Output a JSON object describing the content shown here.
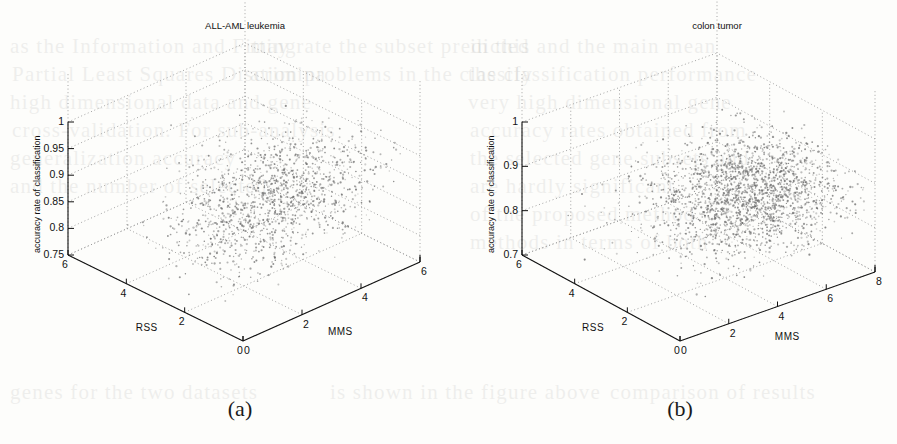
{
  "figure": {
    "background_color": "#fdfdfb",
    "ink_color": "#111111",
    "grid_color": "#9a9a9a",
    "point_color": "#6b6b6b"
  },
  "bleed_through_text": [
    {
      "text": "as the Information and Fitting",
      "x": 10,
      "y": 34
    },
    {
      "text": "may rate the subset predicted",
      "x": 250,
      "y": 34
    },
    {
      "text": "Partial Least Squares Discrimina",
      "x": 12,
      "y": 62
    },
    {
      "text": "ation problems in the classify",
      "x": 250,
      "y": 62
    },
    {
      "text": "high dimensional data and gene",
      "x": 10,
      "y": 90
    },
    {
      "text": "very high dimensional gene",
      "x": 468,
      "y": 90
    },
    {
      "text": "cross-validation. For sub-analysis",
      "x": 12,
      "y": 118
    },
    {
      "text": "the classification performance",
      "x": 468,
      "y": 62
    },
    {
      "text": "in this and the main mean",
      "x": 470,
      "y": 34
    },
    {
      "text": "accuracy rates obtained from",
      "x": 470,
      "y": 118
    },
    {
      "text": "the selected gene subsets and",
      "x": 470,
      "y": 146
    },
    {
      "text": "are hardly significant",
      "x": 470,
      "y": 174
    },
    {
      "text": "of the proposed method",
      "x": 470,
      "y": 202
    },
    {
      "text": "methods in terms of both",
      "x": 470,
      "y": 230
    },
    {
      "text": "generalization accuracy",
      "x": 10,
      "y": 146
    },
    {
      "text": "and the number of selected",
      "x": 10,
      "y": 174
    },
    {
      "text": "genes for the two datasets",
      "x": 10,
      "y": 380
    },
    {
      "text": "is shown in the figure above",
      "x": 330,
      "y": 380
    },
    {
      "text": "comparison of results",
      "x": 610,
      "y": 380
    }
  ],
  "chart_data": [
    {
      "type": "scatter",
      "panel": "a",
      "caption": "(a)",
      "title": "ALL-AML leukemia",
      "projection": "3d",
      "xlabel": "RSS",
      "ylabel": "MMS",
      "zlabel": "accuracy rate of classification",
      "xticks": [
        6,
        4,
        2,
        0
      ],
      "yticks": [
        0,
        2,
        4,
        6
      ],
      "zticks": [
        1,
        0.95,
        0.9,
        0.85,
        0.8,
        0.75
      ],
      "xlim": [
        0,
        6
      ],
      "ylim": [
        0,
        6
      ],
      "zlim": [
        0.75,
        1
      ],
      "grid": true,
      "legend": "none",
      "n_points": 1450,
      "cloud": {
        "description": "elongated diagonal cluster rising from lower-left-front toward upper-right-back",
        "x_center": 2.1,
        "x_spread": 1.1,
        "y_center": 3.1,
        "y_spread": 1.5,
        "z_center": 0.885,
        "z_spread": 0.035,
        "correlation_yz": 0.62
      }
    },
    {
      "type": "scatter",
      "panel": "b",
      "caption": "(b)",
      "title": "colon tumor",
      "projection": "3d",
      "xlabel": "RSS",
      "ylabel": "MMS",
      "zlabel": "accuracy rate of classification",
      "xticks": [
        6,
        4,
        2,
        0
      ],
      "yticks": [
        0,
        2,
        4,
        6,
        8
      ],
      "zticks": [
        1,
        0.9,
        0.8,
        0.7
      ],
      "xlim": [
        0,
        6
      ],
      "ylim": [
        0,
        8
      ],
      "zlim": [
        0.7,
        1
      ],
      "grid": true,
      "legend": "none",
      "n_points": 2300,
      "cloud": {
        "description": "broad dense cluster biased to high MMS, rising gently with MMS",
        "x_center": 2.4,
        "x_spread": 1.3,
        "y_center": 5.6,
        "y_spread": 1.7,
        "z_center": 0.845,
        "z_spread": 0.04,
        "correlation_yz": 0.4
      }
    }
  ]
}
